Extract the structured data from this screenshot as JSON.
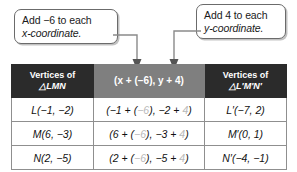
{
  "callouts": [
    {
      "id": "add-x",
      "line1": "Add  −6 to each",
      "line2": "x-coordinate."
    },
    {
      "id": "add-y",
      "line1": "Add 4 to each",
      "line2": "y-coordinate."
    }
  ],
  "table": {
    "header": {
      "col1_line1": "Vertices of",
      "col1_line2": "△LMN",
      "col2": "(x + (−6), y + 4)",
      "col3_line1": "Vertices of",
      "col3_line2": "△L′M′N′"
    },
    "rows": [
      {
        "original": "L(−1, −2)",
        "work_pre_x": "(−1 + (",
        "work_dx": "−6",
        "work_mid": "), −2 + ",
        "work_dy": "4",
        "work_post": ")",
        "image": "L′(−7, 2)"
      },
      {
        "original": "M(6, −3)",
        "work_pre_x": "(6 + (",
        "work_dx": "−6",
        "work_mid": "), −3 + ",
        "work_dy": "4",
        "work_post": ")",
        "image": "M′(0, 1)"
      },
      {
        "original": "N(2, −5)",
        "work_pre_x": "(2 + (",
        "work_dx": "−6",
        "work_mid": "), −5 + ",
        "work_dy": "4",
        "work_post": ")",
        "image": "N′(−4, −1)"
      }
    ]
  },
  "colors": {
    "header_dark": "#2b2b2b",
    "header_gray": "#7f7f7f",
    "border": "#8f8f8f",
    "callout_border": "#6b6b6b",
    "faint_text": "#b9b9b9",
    "connector": "#8a8a8a"
  }
}
